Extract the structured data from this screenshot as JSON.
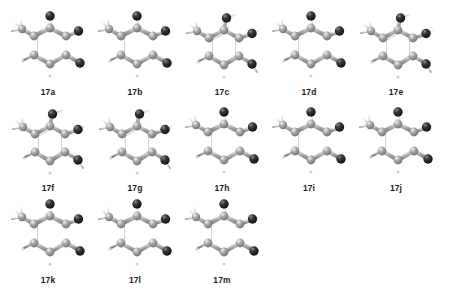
{
  "figure": {
    "background_color": "#ffffff",
    "label_color": "#1a1a1a",
    "atom_dark_color": "#1c1c1c",
    "atom_gray_color": "#8a8a8a",
    "bond_color": "#b3b3b3",
    "hydrogen_color": "#d8d8d8",
    "rows": 3,
    "columns": 5,
    "count": 13
  },
  "structures": [
    {
      "id": "17a",
      "label": "17a",
      "row": 1,
      "col": 1,
      "ring": "six-membered",
      "ring_style": "puckered",
      "methyl_position": "upper-left",
      "dark_substituents": 3,
      "double_bonds": 2
    },
    {
      "id": "17b",
      "label": "17b",
      "row": 1,
      "col": 2,
      "ring": "six-membered",
      "ring_style": "puckered",
      "methyl_position": "upper-left",
      "dark_substituents": 3,
      "double_bonds": 2
    },
    {
      "id": "17c",
      "label": "17c",
      "row": 1,
      "col": 3,
      "ring": "six-membered",
      "ring_style": "planar-aromatic",
      "methyl_position": "upper-left",
      "dark_substituents": 3,
      "double_bonds": 0
    },
    {
      "id": "17d",
      "label": "17d",
      "row": 1,
      "col": 4,
      "ring": "six-membered",
      "ring_style": "puckered",
      "methyl_position": "upper-left",
      "dark_substituents": 3,
      "double_bonds": 2
    },
    {
      "id": "17e",
      "label": "17e",
      "row": 1,
      "col": 5,
      "ring": "six-membered",
      "ring_style": "planar-aromatic",
      "methyl_position": "upper-left",
      "dark_substituents": 3,
      "double_bonds": 0
    },
    {
      "id": "17f",
      "label": "17f",
      "row": 2,
      "col": 1,
      "ring": "six-membered",
      "ring_style": "planar-aromatic",
      "methyl_position": "upper-left",
      "dark_substituents": 3,
      "double_bonds": 0
    },
    {
      "id": "17g",
      "label": "17g",
      "row": 2,
      "col": 2,
      "ring": "six-membered",
      "ring_style": "planar-aromatic",
      "methyl_position": "upper-left",
      "dark_substituents": 3,
      "double_bonds": 0
    },
    {
      "id": "17h",
      "label": "17h",
      "row": 2,
      "col": 3,
      "ring": "six-membered",
      "ring_style": "puckered",
      "methyl_position": "upper-left",
      "dark_substituents": 3,
      "double_bonds": 2
    },
    {
      "id": "17i",
      "label": "17i",
      "row": 2,
      "col": 4,
      "ring": "six-membered",
      "ring_style": "puckered",
      "methyl_position": "upper-left",
      "dark_substituents": 3,
      "double_bonds": 2
    },
    {
      "id": "17j",
      "label": "17j",
      "row": 2,
      "col": 5,
      "ring": "six-membered",
      "ring_style": "puckered",
      "methyl_position": "upper-left",
      "dark_substituents": 3,
      "double_bonds": 2
    },
    {
      "id": "17k",
      "label": "17k",
      "row": 3,
      "col": 1,
      "ring": "six-membered",
      "ring_style": "puckered",
      "methyl_position": "upper-left",
      "dark_substituents": 3,
      "double_bonds": 2
    },
    {
      "id": "17l",
      "label": "17l",
      "row": 3,
      "col": 2,
      "ring": "six-membered",
      "ring_style": "puckered",
      "methyl_position": "upper-left",
      "dark_substituents": 3,
      "double_bonds": 2
    },
    {
      "id": "17m",
      "label": "17m",
      "row": 3,
      "col": 3,
      "ring": "six-membered",
      "ring_style": "puckered",
      "methyl_position": "upper-left",
      "dark_substituents": 3,
      "double_bonds": 2
    }
  ]
}
